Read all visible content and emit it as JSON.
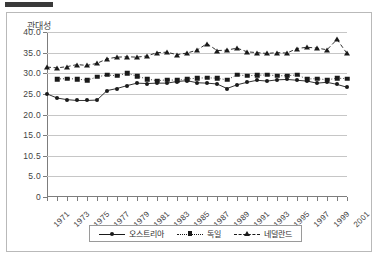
{
  "window": {
    "top_bar_color": "#3a3a3a",
    "border_color": "#b9b9b9"
  },
  "chart_data": {
    "type": "line",
    "title": "관대성",
    "xlabel": "",
    "ylabel": "",
    "ylim": [
      0,
      40
    ],
    "grid": true,
    "legend_position": "bottom",
    "y_ticks": [
      "0",
      "5.0",
      "10.5",
      "15.0",
      "20.0",
      "25.0",
      "30.0",
      "35.0",
      "40.0"
    ],
    "y_tick_values": [
      0,
      5,
      10,
      15,
      20,
      25,
      30,
      35,
      40
    ],
    "x": [
      1971,
      1972,
      1973,
      1974,
      1975,
      1976,
      1977,
      1978,
      1979,
      1980,
      1981,
      1982,
      1983,
      1984,
      1985,
      1986,
      1987,
      1988,
      1989,
      1990,
      1991,
      1992,
      1993,
      1994,
      1995,
      1996,
      1997,
      1998,
      1999,
      2000,
      2001
    ],
    "x_tick_labels": [
      "1971",
      "1973",
      "1975",
      "1977",
      "1979",
      "1981",
      "1983",
      "1985",
      "1987",
      "1989",
      "1991",
      "1993",
      "1995",
      "1997",
      "1999",
      "2001"
    ],
    "series": [
      {
        "name": "오스트리아",
        "marker": "circle",
        "linestyle": "solid",
        "color": "#1a1a1a",
        "values": [
          25.0,
          24.0,
          23.6,
          23.4,
          23.4,
          23.5,
          25.8,
          26.3,
          27.0,
          27.6,
          27.5,
          27.6,
          27.6,
          28.0,
          28.2,
          27.7,
          27.6,
          27.4,
          26.3,
          27.2,
          27.8,
          28.3,
          28.1,
          28.4,
          28.5,
          28.3,
          28.1,
          27.6,
          27.8,
          27.3,
          26.6
        ]
      },
      {
        "name": "독일",
        "marker": "square",
        "linestyle": "dotted",
        "color": "#1a1a1a",
        "values": [
          null,
          28.6,
          28.7,
          28.6,
          28.3,
          29.1,
          29.6,
          29.4,
          30.0,
          29.3,
          28.6,
          28.2,
          28.4,
          28.3,
          28.6,
          28.8,
          28.9,
          28.8,
          28.4,
          29.6,
          29.4,
          29.5,
          29.6,
          29.4,
          29.4,
          29.6,
          28.6,
          28.7,
          28.4,
          28.8,
          28.7
        ]
      },
      {
        "name": "네덜란드",
        "marker": "triangle",
        "linestyle": "dashed",
        "color": "#1a1a1a",
        "values": [
          31.5,
          31.3,
          31.6,
          32.1,
          31.9,
          32.4,
          33.5,
          33.9,
          34.0,
          33.9,
          34.2,
          35.0,
          35.1,
          34.5,
          34.9,
          35.6,
          37.2,
          35.5,
          35.6,
          36.1,
          35.2,
          35.0,
          34.8,
          35.0,
          34.9,
          36.0,
          36.3,
          36.1,
          35.7,
          38.2,
          34.8
        ]
      }
    ]
  }
}
